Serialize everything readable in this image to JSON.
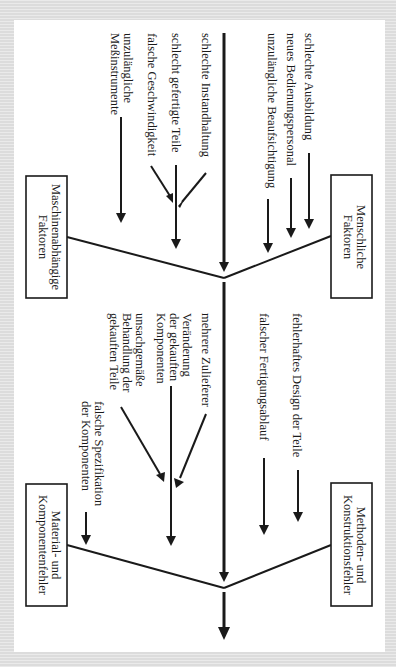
{
  "diagram": {
    "type": "ishikawa-fishbone",
    "orientation": "rotated-90-clockwise",
    "colors": {
      "ink": "#1a1a1a",
      "frame": "#e3e3e3",
      "background": "#ffffff"
    },
    "categories": {
      "human": {
        "label_line1": "Menschliche",
        "label_line2": "Faktoren",
        "causes": [
          "schlechte Ausbildung",
          "neues Bedienungspersonal",
          "unzulängliche Beaufsichtigung"
        ]
      },
      "machine": {
        "label_line1": "Maschinenabhängige",
        "label_line2": "Faktoren",
        "causes": [
          "schlechte Instandhaltung",
          "schlecht gefertigte Teile",
          "falsche Geschwindigkeit",
          "unzulängliche",
          "Meßinstrumente"
        ]
      },
      "method": {
        "label_line1": "Methoden- und",
        "label_line2": "Konstruktionsfehler",
        "causes": [
          "fehlerhaftes Design der Teile",
          "falscher Fertigungsablauf"
        ]
      },
      "material": {
        "label_line1": "Material- und",
        "label_line2": "Komponentenfehler",
        "causes": [
          "mehrere Zulieferer",
          "Veränderung",
          "der gekauften",
          "Komponenten",
          "unsachgemäße",
          "Behandlung der",
          "gekauften Teile",
          "falsche Spezifikation",
          "der Komponenten"
        ]
      }
    }
  }
}
